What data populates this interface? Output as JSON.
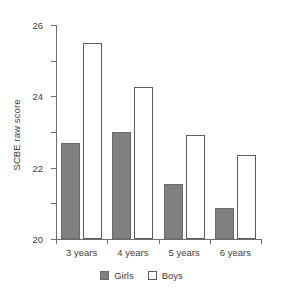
{
  "chart_data": {
    "type": "bar",
    "title": "",
    "xlabel": "",
    "ylabel": "SCBE raw score",
    "categories": [
      "3 years",
      "4 years",
      "5 years",
      "6 years"
    ],
    "series": [
      {
        "name": "Girls",
        "values": [
          19.4,
          20.0,
          17.1,
          15.75
        ],
        "color": "#808080"
      },
      {
        "name": "Boys",
        "values": [
          25.0,
          22.55,
          19.85,
          18.7
        ],
        "color": "#ffffff"
      }
    ],
    "ylim": [
      14,
      26
    ],
    "yticks": [
      14,
      16,
      18,
      20,
      22,
      24,
      26
    ],
    "ytick_labels": [
      "14",
      "16",
      "18",
      "20",
      "22",
      "24",
      "26"
    ],
    "grid": false,
    "legend_position": "bottom"
  },
  "legend": {
    "items": [
      {
        "label": "Girls"
      },
      {
        "label": "Boys"
      }
    ]
  }
}
